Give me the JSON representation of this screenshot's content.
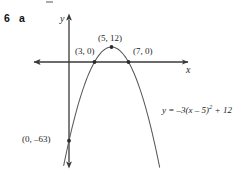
{
  "question": {
    "number": "6",
    "part": "a"
  },
  "axes": {
    "x_label": "x",
    "y_label": "y",
    "x_axis_color": "#3a3a3a",
    "y_axis_color": "#3a3a3a",
    "grid": false
  },
  "curve": {
    "color": "#5a5a5a",
    "equation_display": "y = –3(x – 5)",
    "equation_exponent": "2",
    "equation_tail": " + 12"
  },
  "labels": {
    "vertex": "(5, 12)",
    "root_left": "(3, 0)",
    "root_right": "(7, 0)",
    "y_intercept": "(0, –63)"
  },
  "chart_data": {
    "type": "line",
    "title": "",
    "subtitle": "",
    "xlabel": "x",
    "ylabel": "y",
    "grid": false,
    "legend": [],
    "equation": "y = -3(x - 5)^2 + 12",
    "vertex": [
      5,
      12
    ],
    "roots": [
      [
        3,
        0
      ],
      [
        7,
        0
      ]
    ],
    "y_intercept": [
      0,
      -63
    ],
    "opens": "down",
    "leading_coefficient": -3,
    "axis_of_symmetry": 5,
    "xlim": [
      -3.5,
      14.5
    ],
    "ylim": [
      -90,
      22
    ],
    "annotations": [
      {
        "text": "(5, 12)",
        "x": 5,
        "y": 12
      },
      {
        "text": "(3, 0)",
        "x": 3,
        "y": 0
      },
      {
        "text": "(7, 0)",
        "x": 7,
        "y": 0
      },
      {
        "text": "(0, -63)",
        "x": 0,
        "y": -63
      },
      {
        "text": "y = -3(x - 5)^2 + 12",
        "x": 11,
        "y": -35
      }
    ],
    "marked_points": [
      {
        "x": 5,
        "y": 12
      },
      {
        "x": 3,
        "y": 0
      },
      {
        "x": 7,
        "y": 0
      },
      {
        "x": 0,
        "y": -63
      }
    ],
    "x": [
      -0.6,
      0,
      1,
      2,
      3,
      4,
      5,
      6,
      7,
      8,
      9,
      10,
      10.6
    ],
    "y": [
      -84.7,
      -63,
      -36,
      -15,
      0,
      9,
      12,
      9,
      0,
      -15,
      -36,
      -63,
      -82.1
    ]
  }
}
